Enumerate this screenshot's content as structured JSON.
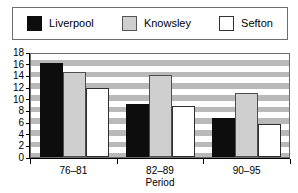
{
  "chart_data": {
    "type": "bar",
    "title": "",
    "xlabel": "Period",
    "ylabel": "",
    "categories": [
      "76–81",
      "82–89",
      "90–95"
    ],
    "series": [
      {
        "name": "Liverpool",
        "color": "#0d0d0d",
        "values": [
          16.2,
          9.1,
          6.7
        ]
      },
      {
        "name": "Knowsley",
        "color": "#cfcfcf",
        "values": [
          14.5,
          14.0,
          11.0
        ]
      },
      {
        "name": "Sefton",
        "color": "#ffffff",
        "values": [
          11.9,
          8.7,
          5.7
        ]
      }
    ],
    "ylim": [
      0,
      18
    ],
    "ytick_step": 2,
    "yticks": [
      0,
      2,
      4,
      6,
      8,
      10,
      12,
      14,
      16,
      18
    ],
    "ytick_labels": [
      "0",
      "2",
      "4",
      "6",
      "8",
      "10",
      "12",
      "14",
      "16",
      "18"
    ],
    "grid": "horizontal-bands",
    "legend_position": "top"
  },
  "legend": {
    "entries": [
      {
        "label": "Liverpool",
        "swatch": "liverpool"
      },
      {
        "label": "Knowsley",
        "swatch": "knowsley"
      },
      {
        "label": "Sefton",
        "swatch": "sefton"
      }
    ]
  }
}
